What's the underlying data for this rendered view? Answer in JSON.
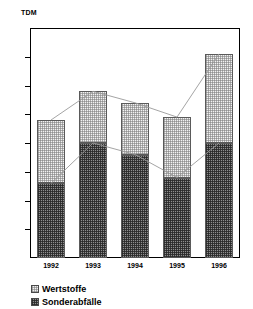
{
  "chart_data": {
    "type": "bar",
    "subtype": "stacked-column-with-series-lines",
    "title": "",
    "xlabel": "",
    "ylabel": "TDM",
    "categories": [
      "1992",
      "1993",
      "1994",
      "1995",
      "1996"
    ],
    "series": [
      {
        "name": "Wertstoffe",
        "values": [
          22,
          18,
          18,
          21,
          31
        ]
      },
      {
        "name": "Sonderabfälle",
        "values": [
          26,
          40,
          36,
          28,
          40
        ]
      }
    ],
    "totals": [
      48,
      58,
      54,
      49,
      71
    ],
    "ylim": [
      0,
      80
    ],
    "ytick_step": 10,
    "yticks": [
      "0",
      "10",
      "20",
      "30",
      "40",
      "50",
      "60",
      "70",
      "80"
    ],
    "grid": false,
    "legend_position": "bottom-left",
    "series_lines": true,
    "colors": {
      "wertstoffe_fill": "#f2f2f2",
      "sonderabfaelle_fill": "#8e8e8e",
      "outline": "#5a5a5a",
      "axis": "#000000",
      "connector_line": "#9a9a9a"
    }
  }
}
